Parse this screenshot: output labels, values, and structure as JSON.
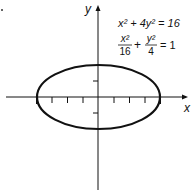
{
  "figure": {
    "axes": {
      "x_label": "x",
      "y_label": "y"
    },
    "equations": {
      "line1": "x² + 4y² = 16",
      "line2_frac1_num": "x²",
      "line2_frac1_den": "16",
      "line2_plus": "+",
      "line2_frac2_num": "y²",
      "line2_frac2_den": "4",
      "line2_rhs": "= 1"
    },
    "ellipse": {
      "semi_major_x": 4,
      "semi_minor_y": 2,
      "center": [
        0,
        0
      ]
    },
    "ticks": {
      "x": [
        -4,
        -3,
        -2,
        -1,
        1,
        2,
        3,
        4
      ],
      "y": [
        -1,
        1
      ]
    }
  }
}
